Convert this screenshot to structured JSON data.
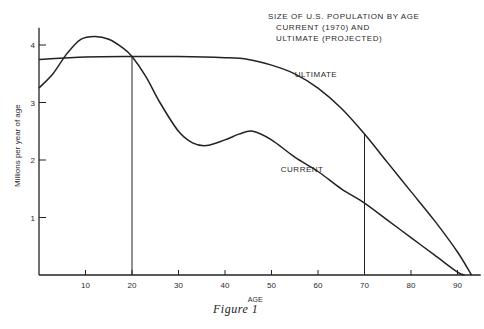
{
  "chart_data": {
    "type": "line",
    "title": "SIZE OF U.S. POPULATION BY AGE",
    "subtitle_lines": [
      "CURRENT (1970) AND",
      "ULTIMATE (PROJECTED)"
    ],
    "xlabel": "AGE",
    "ylabel": "Millions per year of age",
    "xlim": [
      0,
      95
    ],
    "ylim": [
      0,
      4.3
    ],
    "x_ticks": [
      10,
      20,
      30,
      40,
      50,
      60,
      70,
      80,
      90
    ],
    "y_ticks": [
      1,
      2,
      3,
      4
    ],
    "grid": false,
    "legend_position": "inline labels",
    "annotations": [
      {
        "text": "ULTIMATE",
        "x": 55,
        "y": 3.45
      },
      {
        "text": "CURRENT",
        "x": 52,
        "y": 1.8
      }
    ],
    "reference_lines": [
      {
        "orientation": "vertical",
        "x": 20
      },
      {
        "orientation": "vertical",
        "x": 70
      }
    ],
    "series": [
      {
        "name": "CURRENT",
        "x": [
          0,
          3,
          6,
          9,
          12,
          15,
          18,
          20,
          23,
          26,
          30,
          33,
          36,
          40,
          43,
          46,
          50,
          55,
          60,
          65,
          70,
          75,
          80,
          85,
          90,
          91.5
        ],
        "values": [
          3.25,
          3.5,
          3.85,
          4.1,
          4.15,
          4.1,
          3.95,
          3.8,
          3.45,
          3.0,
          2.5,
          2.3,
          2.25,
          2.35,
          2.45,
          2.5,
          2.35,
          2.05,
          1.8,
          1.5,
          1.25,
          0.95,
          0.65,
          0.35,
          0.05,
          0
        ]
      },
      {
        "name": "ULTIMATE",
        "x": [
          0,
          10,
          20,
          30,
          40,
          45,
          50,
          55,
          60,
          65,
          70,
          75,
          80,
          85,
          90,
          93
        ],
        "values": [
          3.75,
          3.79,
          3.8,
          3.8,
          3.78,
          3.75,
          3.65,
          3.5,
          3.25,
          2.9,
          2.45,
          1.95,
          1.45,
          0.95,
          0.4,
          0
        ]
      }
    ]
  },
  "figure": {
    "title": "SIZE OF U.S. POPULATION BY AGE",
    "subtitle1": "CURRENT (1970) AND",
    "subtitle2": "ULTIMATE (PROJECTED)",
    "caption": "Figure 1",
    "label_ultimate": "ULTIMATE",
    "label_current": "CURRENT",
    "xlabel": "AGE",
    "ylabel": "Millions per year of age",
    "x_tick_labels": [
      "10",
      "20",
      "30",
      "40",
      "50",
      "60",
      "70",
      "80",
      "90"
    ],
    "y_tick_labels": [
      "1",
      "2",
      "3",
      "4"
    ],
    "line_color": "#222222"
  }
}
